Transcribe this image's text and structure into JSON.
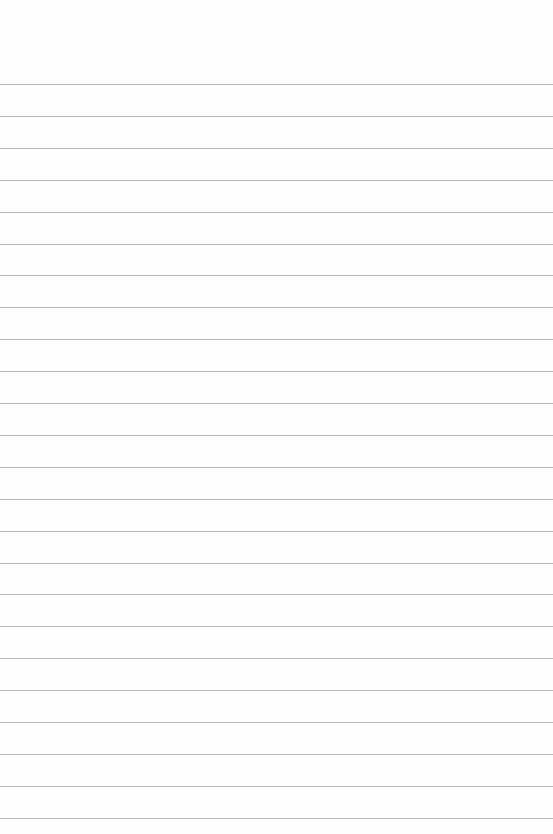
{
  "paper": {
    "type": "lined-paper",
    "line_count": 24,
    "first_line_y": 84,
    "line_spacing": 31.9,
    "line_color": "#a8a8a8",
    "background_color": "#fefefe"
  }
}
